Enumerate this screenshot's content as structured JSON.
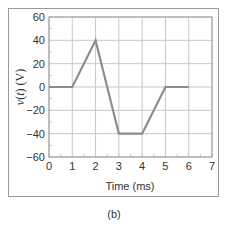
{
  "figure": {
    "caption": "(b)"
  },
  "chart_data": {
    "type": "line",
    "title": "",
    "xlabel": "Time (ms)",
    "ylabel": "v(t) (V)",
    "xlim": [
      0,
      7
    ],
    "ylim": [
      -60,
      60
    ],
    "xticks": [
      0,
      1,
      2,
      3,
      4,
      5,
      6,
      7
    ],
    "yticks": [
      60,
      40,
      20,
      0,
      -20,
      -40,
      -60
    ],
    "grid": true,
    "legend": null,
    "series": [
      {
        "name": "v(t)",
        "x": [
          0,
          1,
          2,
          3,
          4,
          5,
          6
        ],
        "y": [
          0,
          0,
          40,
          -40,
          -40,
          0,
          0
        ],
        "color": "#8c8c8c"
      }
    ]
  },
  "colors": {
    "line": "#8c8c8c",
    "grid": "#c8c8c8",
    "axis": "#9a9a9a",
    "text": "#333333"
  }
}
